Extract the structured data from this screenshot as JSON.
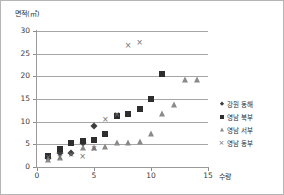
{
  "chart_data": {
    "type": "scatter",
    "title": "면적(㎡)",
    "xlabel": "수량",
    "ylabel": "면적(㎡)",
    "xlim": [
      0,
      15
    ],
    "ylim": [
      0,
      30
    ],
    "x_ticks": [
      "0",
      "5",
      "10",
      "15"
    ],
    "x_tick_values": [
      0,
      5,
      10,
      15
    ],
    "y_ticks": [
      "0",
      "5",
      "10",
      "15",
      "20",
      "25",
      "30"
    ],
    "y_tick_values": [
      0,
      5,
      10,
      15,
      20,
      25,
      30
    ],
    "grid": "horizontal",
    "legend_position": "right",
    "series": [
      {
        "name": "강원 동해",
        "marker": "diamond",
        "color": "#3c3c3c",
        "points": [
          {
            "x": 1,
            "y": 2.0
          },
          {
            "x": 2,
            "y": 3.0
          },
          {
            "x": 3,
            "y": 3.0
          },
          {
            "x": 4,
            "y": 5.2
          },
          {
            "x": 5,
            "y": 9.0
          }
        ]
      },
      {
        "name": "영남 북부",
        "marker": "square",
        "color": "#2e2e2e",
        "points": [
          {
            "x": 1,
            "y": 2.5
          },
          {
            "x": 2,
            "y": 4.0
          },
          {
            "x": 3,
            "y": 5.2
          },
          {
            "x": 4,
            "y": 5.7
          },
          {
            "x": 5,
            "y": 6.0
          },
          {
            "x": 6,
            "y": 7.2
          },
          {
            "x": 7,
            "y": 11.2
          },
          {
            "x": 8,
            "y": 11.8
          },
          {
            "x": 9,
            "y": 12.7
          },
          {
            "x": 10,
            "y": 15.1
          },
          {
            "x": 11,
            "y": 20.6
          }
        ]
      },
      {
        "name": "영남 서부",
        "marker": "triangle",
        "color": "#8a8a8a",
        "points": [
          {
            "x": 1,
            "y": 1.5
          },
          {
            "x": 2,
            "y": 2.0
          },
          {
            "x": 4,
            "y": 4.2
          },
          {
            "x": 5,
            "y": 4.3
          },
          {
            "x": 6,
            "y": 4.5
          },
          {
            "x": 7,
            "y": 5.2
          },
          {
            "x": 8,
            "y": 5.2
          },
          {
            "x": 9,
            "y": 5.6
          },
          {
            "x": 10,
            "y": 7.2
          },
          {
            "x": 11,
            "y": 11.7
          },
          {
            "x": 12,
            "y": 13.7
          },
          {
            "x": 13,
            "y": 19.2
          },
          {
            "x": 14,
            "y": 19.3
          }
        ]
      },
      {
        "name": "영남 동부",
        "marker": "cross",
        "color": "#6d6d6d",
        "points": [
          {
            "x": 1,
            "y": 2.3
          },
          {
            "x": 2,
            "y": 2.2
          },
          {
            "x": 3,
            "y": 2.8
          },
          {
            "x": 4,
            "y": 2.5
          },
          {
            "x": 5,
            "y": 4.3
          },
          {
            "x": 6,
            "y": 10.5
          },
          {
            "x": 7,
            "y": 11.8
          },
          {
            "x": 8,
            "y": 26.9
          },
          {
            "x": 9,
            "y": 27.5
          }
        ]
      }
    ]
  }
}
